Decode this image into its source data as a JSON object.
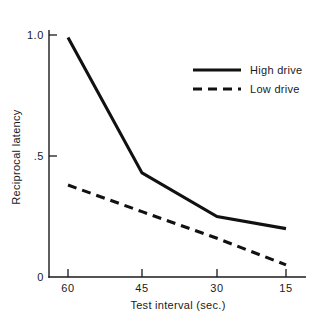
{
  "chart_data": {
    "type": "line",
    "title": "",
    "xlabel": "Test interval (sec.)",
    "ylabel": "Reciprocal latency",
    "categories": [
      "60",
      "45",
      "30",
      "15"
    ],
    "x": [
      60,
      45,
      30,
      15
    ],
    "xlim": [
      60,
      15
    ],
    "ylim": [
      0,
      1.0
    ],
    "ytick_labels": [
      "0",
      ".5",
      "1.0"
    ],
    "yticks": [
      0,
      0.5,
      1.0
    ],
    "grid": false,
    "legend_position": "upper right",
    "series": [
      {
        "name": "High drive",
        "style": "solid",
        "color": "#111111",
        "values": [
          0.99,
          0.43,
          0.25,
          0.2
        ]
      },
      {
        "name": "Low drive",
        "style": "dashed",
        "color": "#111111",
        "values": [
          0.38,
          0.27,
          0.16,
          0.05
        ]
      }
    ]
  },
  "axes": {
    "y_label": "Reciprocal latency",
    "y_tick_top": "1.0",
    "y_tick_mid": ".5",
    "y_tick_zero": "0",
    "x_label": "Test interval (sec.)",
    "x_tick_1": "60",
    "x_tick_2": "45",
    "x_tick_3": "30",
    "x_tick_4": "15"
  },
  "legend": {
    "entry_1": "High drive",
    "entry_2": "Low drive"
  }
}
